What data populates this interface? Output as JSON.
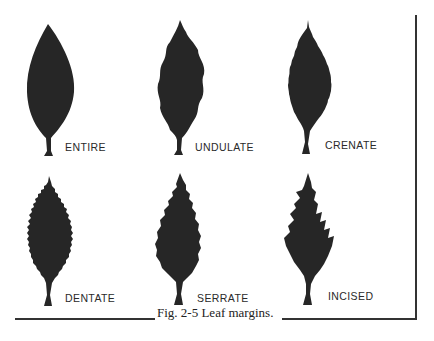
{
  "figure": {
    "caption": "Fig. 2-5  Leaf margins.",
    "leaf_color": "#262626",
    "rule_color": "#333333",
    "leaves": [
      {
        "label": "ENTIRE",
        "margin_type": "entire"
      },
      {
        "label": "UNDULATE",
        "margin_type": "undulate"
      },
      {
        "label": "CRENATE",
        "margin_type": "crenate"
      },
      {
        "label": "DENTATE",
        "margin_type": "dentate"
      },
      {
        "label": "SERRATE",
        "margin_type": "serrate"
      },
      {
        "label": "INCISED",
        "margin_type": "incised"
      }
    ]
  }
}
